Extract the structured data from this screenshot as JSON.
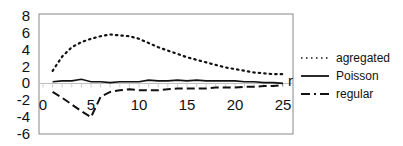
{
  "chart_data": {
    "type": "line",
    "title": "",
    "xlabel": "r",
    "ylabel": "",
    "xlim": [
      0,
      25
    ],
    "ylim": [
      -6,
      8
    ],
    "x_ticks": [
      0,
      5,
      10,
      15,
      20,
      25
    ],
    "y_ticks": [
      8,
      6,
      4,
      2,
      0,
      -2,
      -4,
      -6
    ],
    "grid": false,
    "legend_position": "right",
    "x": [
      1,
      2,
      3,
      4,
      5,
      6,
      7,
      8,
      9,
      10,
      11,
      12,
      13,
      14,
      15,
      16,
      17,
      18,
      19,
      20,
      21,
      22,
      23,
      24,
      25
    ],
    "series": [
      {
        "name": "agregated",
        "style": "dotted",
        "values": [
          1.5,
          3.2,
          4.3,
          4.9,
          5.3,
          5.6,
          5.8,
          5.7,
          5.6,
          5.3,
          4.8,
          4.3,
          3.9,
          3.5,
          3.1,
          2.8,
          2.5,
          2.2,
          1.9,
          1.7,
          1.5,
          1.3,
          1.2,
          1.1,
          1.1
        ]
      },
      {
        "name": "Poisson",
        "style": "solid",
        "values": [
          0.2,
          0.3,
          0.3,
          0.5,
          0.2,
          0.2,
          0.1,
          0.2,
          0.2,
          0.2,
          0.4,
          0.3,
          0.3,
          0.4,
          0.3,
          0.4,
          0.3,
          0.3,
          0.3,
          0.3,
          0.2,
          0.2,
          0.1,
          0.1,
          0.0
        ]
      },
      {
        "name": "regular",
        "style": "dash-dot",
        "values": [
          -1.0,
          -1.7,
          -2.5,
          -3.3,
          -4.0,
          -1.6,
          -1.0,
          -0.8,
          -0.7,
          -0.8,
          -0.8,
          -0.8,
          -0.7,
          -0.6,
          -0.6,
          -0.6,
          -0.6,
          -0.5,
          -0.5,
          -0.5,
          -0.4,
          -0.4,
          -0.3,
          -0.3,
          -0.2
        ]
      }
    ]
  },
  "legend": {
    "items": [
      "agregated",
      "Poisson",
      "regular"
    ]
  },
  "axis": {
    "x_label": "r",
    "y_tick_labels": [
      "8",
      "6",
      "4",
      "2",
      "0",
      "-2",
      "-4",
      "-6"
    ],
    "x_tick_labels": [
      "0",
      "5",
      "10",
      "15",
      "20",
      "25"
    ]
  }
}
